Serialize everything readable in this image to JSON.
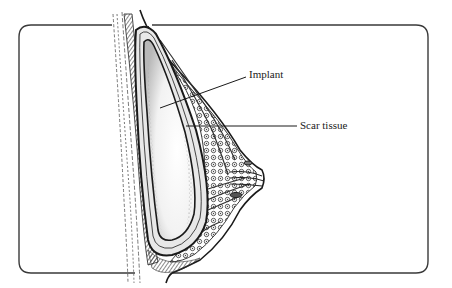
{
  "figure": {
    "type": "anatomical cross-section illustration",
    "frame": {
      "shape": "rounded rectangle",
      "stroke_color": "#3a3a3a",
      "background": "#ffffff"
    },
    "labels": [
      {
        "id": "implant",
        "text": "Implant",
        "leader": "diagonal line pointing to implant interior"
      },
      {
        "id": "scar",
        "text": "Scar tissue",
        "leader": "horizontal line pointing to capsule around implant"
      }
    ],
    "colors": {
      "ink": "#1a1a1a",
      "implant_fill": "#f4f4f4",
      "tissue_shade": "#6a6a6a",
      "paper": "#ffffff"
    }
  }
}
